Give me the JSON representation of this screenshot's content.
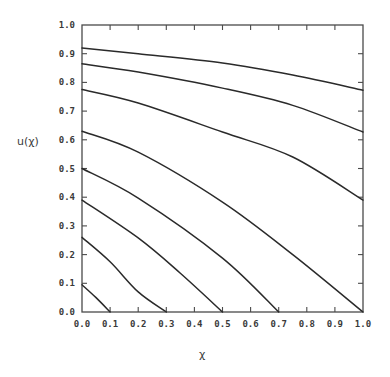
{
  "chart_data": {
    "type": "line",
    "title": "",
    "xlabel": "χ",
    "ylabel": "u(χ)",
    "xlim": [
      0.0,
      1.0
    ],
    "ylim": [
      0.0,
      1.0
    ],
    "grid": false,
    "legend": null,
    "x_ticks": [
      "0.0",
      "0.1",
      "0.2",
      "0.3",
      "0.4",
      "0.5",
      "0.6",
      "0.7",
      "0.8",
      "0.9",
      "1.0"
    ],
    "y_ticks": [
      "0.0",
      "0.1",
      "0.2",
      "0.3",
      "0.4",
      "0.5",
      "0.6",
      "0.7",
      "0.8",
      "0.9",
      "1.0"
    ],
    "series": [
      {
        "name": "curve-1",
        "x": [
          0.0,
          0.2,
          0.5,
          0.75,
          1.0
        ],
        "y": [
          0.92,
          0.9,
          0.868,
          0.826,
          0.773
        ]
      },
      {
        "name": "curve-2",
        "x": [
          0.0,
          0.2,
          0.5,
          0.75,
          1.0
        ],
        "y": [
          0.865,
          0.836,
          0.78,
          0.72,
          0.627
        ]
      },
      {
        "name": "curve-3",
        "x": [
          0.0,
          0.2,
          0.5,
          0.75,
          1.0
        ],
        "y": [
          0.775,
          0.728,
          0.627,
          0.54,
          0.39
        ]
      },
      {
        "name": "curve-4",
        "x": [
          0.0,
          0.2,
          0.5,
          0.75,
          1.0
        ],
        "y": [
          0.63,
          0.557,
          0.383,
          0.2,
          0.0
        ]
      },
      {
        "name": "curve-5",
        "x": [
          0.0,
          0.2,
          0.5,
          0.7
        ],
        "y": [
          0.5,
          0.397,
          0.188,
          0.0
        ]
      },
      {
        "name": "curve-6",
        "x": [
          0.0,
          0.2,
          0.35,
          0.5
        ],
        "y": [
          0.39,
          0.258,
          0.135,
          0.0
        ]
      },
      {
        "name": "curve-7",
        "x": [
          0.0,
          0.1,
          0.2,
          0.3
        ],
        "y": [
          0.26,
          0.175,
          0.07,
          0.0
        ]
      },
      {
        "name": "curve-8",
        "x": [
          0.0,
          0.05,
          0.1
        ],
        "y": [
          0.095,
          0.05,
          0.0
        ]
      }
    ]
  },
  "plot": {
    "left": 82,
    "top": 25,
    "right": 363,
    "bottom": 312
  }
}
